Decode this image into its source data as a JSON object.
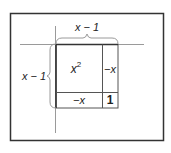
{
  "diagram": {
    "top_label": "x − 1",
    "left_label": "x − 1",
    "cells": {
      "top_left": {
        "base": "x",
        "exponent": "2"
      },
      "top_right": "−x",
      "bottom_left": "−x",
      "bottom_right": "1"
    },
    "colors": {
      "frame": "#333333",
      "grid": "#555555",
      "axis": "#9a9a9a",
      "brace": "#9a9a9a",
      "text": "#222222"
    }
  }
}
